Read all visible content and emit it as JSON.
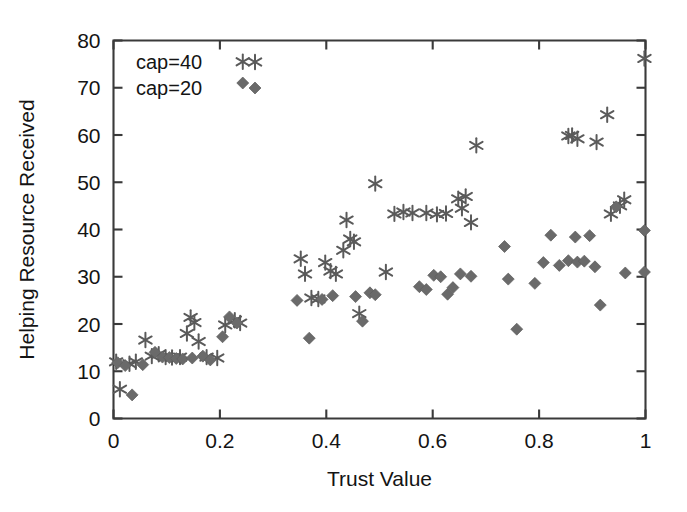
{
  "chart_data": {
    "type": "scatter",
    "title": "",
    "xlabel": "Trust Value",
    "ylabel": "Helping Resource Received",
    "xlim": [
      0,
      1
    ],
    "ylim": [
      0,
      80
    ],
    "xticks": [
      0,
      0.2,
      0.4,
      0.6,
      0.8,
      1
    ],
    "xticklabels": [
      "0",
      "0.2",
      "0.4",
      "0.6",
      "0.8",
      "1"
    ],
    "yticks": [
      0,
      10,
      20,
      30,
      40,
      50,
      60,
      70,
      80
    ],
    "yticklabels": [
      "0",
      "10",
      "20",
      "30",
      "40",
      "50",
      "60",
      "70",
      "80"
    ],
    "grid": false,
    "legend_position": "upper left",
    "series": [
      {
        "name": "cap=40",
        "marker": "asterisk",
        "color": "#5a5a5a",
        "points": [
          [
            0.005,
            12.0
          ],
          [
            0.012,
            6.2
          ],
          [
            0.03,
            11.6
          ],
          [
            0.042,
            12.0
          ],
          [
            0.06,
            16.6
          ],
          [
            0.072,
            13.2
          ],
          [
            0.085,
            13.6
          ],
          [
            0.098,
            13.0
          ],
          [
            0.11,
            12.9
          ],
          [
            0.125,
            13.0
          ],
          [
            0.138,
            18.0
          ],
          [
            0.145,
            21.4
          ],
          [
            0.152,
            20.3
          ],
          [
            0.16,
            16.3
          ],
          [
            0.175,
            13.0
          ],
          [
            0.195,
            12.8
          ],
          [
            0.21,
            19.8
          ],
          [
            0.228,
            20.8
          ],
          [
            0.238,
            20.2
          ],
          [
            0.243,
            75.5
          ],
          [
            0.352,
            33.8
          ],
          [
            0.36,
            30.6
          ],
          [
            0.372,
            25.5
          ],
          [
            0.385,
            25.3
          ],
          [
            0.398,
            33.0
          ],
          [
            0.408,
            31.2
          ],
          [
            0.418,
            30.6
          ],
          [
            0.432,
            35.6
          ],
          [
            0.438,
            42.0
          ],
          [
            0.445,
            38.0
          ],
          [
            0.452,
            37.4
          ],
          [
            0.462,
            22.2
          ],
          [
            0.492,
            49.7
          ],
          [
            0.512,
            31.0
          ],
          [
            0.528,
            43.3
          ],
          [
            0.545,
            43.7
          ],
          [
            0.562,
            43.5
          ],
          [
            0.588,
            43.5
          ],
          [
            0.608,
            43.2
          ],
          [
            0.625,
            43.4
          ],
          [
            0.648,
            46.5
          ],
          [
            0.655,
            44.5
          ],
          [
            0.662,
            47.0
          ],
          [
            0.672,
            41.5
          ],
          [
            0.682,
            57.8
          ],
          [
            0.855,
            59.8
          ],
          [
            0.862,
            59.9
          ],
          [
            0.872,
            59.2
          ],
          [
            0.908,
            58.5
          ],
          [
            0.928,
            64.3
          ],
          [
            0.935,
            43.3
          ],
          [
            0.952,
            45.0
          ],
          [
            0.96,
            46.3
          ],
          [
            0.998,
            76.2
          ]
        ]
      },
      {
        "name": "cap=20",
        "marker": "diamond",
        "color": "#6a6a6a",
        "points": [
          [
            0.008,
            11.8
          ],
          [
            0.022,
            11.2
          ],
          [
            0.035,
            5.0
          ],
          [
            0.055,
            11.4
          ],
          [
            0.078,
            14.0
          ],
          [
            0.092,
            13.0
          ],
          [
            0.105,
            12.9
          ],
          [
            0.118,
            12.7
          ],
          [
            0.13,
            12.6
          ],
          [
            0.148,
            12.8
          ],
          [
            0.168,
            13.2
          ],
          [
            0.182,
            12.4
          ],
          [
            0.205,
            17.3
          ],
          [
            0.218,
            21.5
          ],
          [
            0.232,
            20.2
          ],
          [
            0.243,
            71.0
          ],
          [
            0.345,
            25.0
          ],
          [
            0.368,
            17.0
          ],
          [
            0.392,
            25.2
          ],
          [
            0.412,
            26.0
          ],
          [
            0.455,
            25.8
          ],
          [
            0.468,
            20.6
          ],
          [
            0.482,
            26.6
          ],
          [
            0.492,
            26.2
          ],
          [
            0.575,
            27.9
          ],
          [
            0.588,
            27.3
          ],
          [
            0.602,
            30.3
          ],
          [
            0.615,
            30.0
          ],
          [
            0.628,
            26.3
          ],
          [
            0.638,
            27.7
          ],
          [
            0.652,
            30.6
          ],
          [
            0.672,
            30.1
          ],
          [
            0.735,
            36.4
          ],
          [
            0.742,
            29.5
          ],
          [
            0.758,
            18.9
          ],
          [
            0.792,
            28.6
          ],
          [
            0.808,
            33.0
          ],
          [
            0.822,
            38.8
          ],
          [
            0.838,
            32.4
          ],
          [
            0.855,
            33.4
          ],
          [
            0.868,
            38.4
          ],
          [
            0.872,
            33.1
          ],
          [
            0.885,
            33.3
          ],
          [
            0.895,
            38.7
          ],
          [
            0.905,
            32.1
          ],
          [
            0.915,
            24.0
          ],
          [
            0.945,
            44.8
          ],
          [
            0.962,
            30.8
          ],
          [
            0.998,
            39.8
          ],
          [
            0.998,
            31.0
          ]
        ]
      }
    ]
  },
  "legend": {
    "items": [
      {
        "label": "cap=40"
      },
      {
        "label": "cap=20"
      }
    ]
  }
}
